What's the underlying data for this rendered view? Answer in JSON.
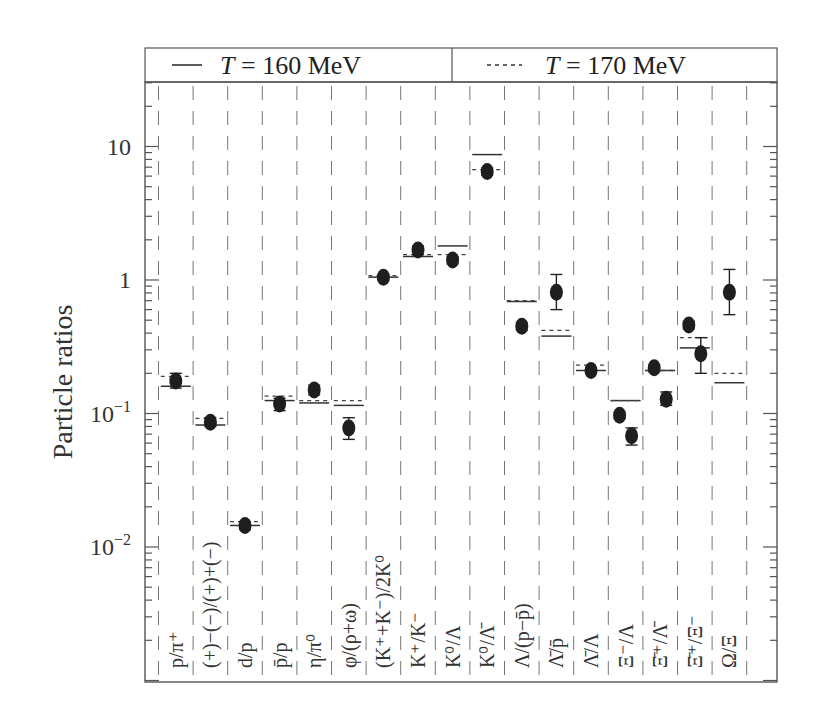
{
  "chart_data": {
    "type": "scatter",
    "title": "",
    "xlabel": "",
    "ylabel": "Particle ratios",
    "yscale": "log",
    "ylim": [
      0.001,
      30
    ],
    "yticks": [
      {
        "value": 10,
        "label": "10"
      },
      {
        "value": 1,
        "label": "1"
      },
      {
        "value": 0.1,
        "label": "10",
        "exp": "−1"
      },
      {
        "value": 0.01,
        "label": "10",
        "exp": "−2"
      }
    ],
    "grid": "vertical dashed separators between categories",
    "legend": {
      "position": "top, boxed",
      "entries": [
        {
          "name": "T = 160 MeV",
          "style": "solid"
        },
        {
          "name": "T = 170 MeV",
          "style": "dashed"
        }
      ]
    },
    "categories": [
      "p/π⁺",
      "(+)−(−)/(+)+(−)",
      "d/p",
      "p̄/p",
      "η/π⁰",
      "φ/(ρ+ω)",
      "(K⁺+K⁻)/2K⁰",
      "K⁺/K⁻",
      "K⁰/Λ",
      "K⁰/Λ̄",
      "Λ/(p−p̄)",
      "Λ̄/p̄",
      "Λ̄/Λ",
      "Ξ⁻/Λ",
      "Ξ̄⁺/Λ̄",
      "Ξ̄⁺/Ξ⁻",
      "Ω/Ξ"
    ],
    "series": [
      {
        "name": "Data",
        "marker": "filled ellipse with error bars",
        "points": [
          {
            "cat": 0,
            "value": 0.175,
            "err_lo": 0.155,
            "err_hi": 0.2
          },
          {
            "cat": 1,
            "value": 0.086,
            "err_lo": 0.08,
            "err_hi": 0.093
          },
          {
            "cat": 2,
            "value": 0.0145,
            "err_lo": 0.0135,
            "err_hi": 0.0155
          },
          {
            "cat": 3,
            "value": 0.118,
            "err_lo": 0.105,
            "err_hi": 0.13
          },
          {
            "cat": 4,
            "value": 0.15,
            "err_lo": 0.138,
            "err_hi": 0.163
          },
          {
            "cat": 5,
            "value": 0.078,
            "err_lo": 0.064,
            "err_hi": 0.093
          },
          {
            "cat": 6,
            "value": 1.05,
            "err_lo": 1.0,
            "err_hi": 1.1
          },
          {
            "cat": 7,
            "value": 1.68,
            "err_lo": 1.55,
            "err_hi": 1.8
          },
          {
            "cat": 8,
            "value": 1.41,
            "err_lo": 1.32,
            "err_hi": 1.5
          },
          {
            "cat": 9,
            "value": 6.5,
            "err_lo": 6.1,
            "err_hi": 6.9
          },
          {
            "cat": 10,
            "value": 0.45,
            "err_lo": 0.42,
            "err_hi": 0.48
          },
          {
            "cat": 11,
            "value": 0.81,
            "err_lo": 0.6,
            "err_hi": 1.1
          },
          {
            "cat": 12,
            "value": 0.21,
            "err_lo": 0.2,
            "err_hi": 0.22
          },
          {
            "cat": 13,
            "value": 0.097,
            "err_lo": 0.092,
            "err_hi": 0.102
          },
          {
            "cat": 13,
            "value": 0.068,
            "err_lo": 0.058,
            "err_hi": 0.078
          },
          {
            "cat": 14,
            "value": 0.22,
            "err_lo": 0.205,
            "err_hi": 0.23
          },
          {
            "cat": 14,
            "value": 0.128,
            "err_lo": 0.115,
            "err_hi": 0.145
          },
          {
            "cat": 15,
            "value": 0.46,
            "err_lo": 0.43,
            "err_hi": 0.49
          },
          {
            "cat": 15,
            "value": 0.28,
            "err_lo": 0.2,
            "err_hi": 0.37
          },
          {
            "cat": 16,
            "value": 0.81,
            "err_lo": 0.55,
            "err_hi": 1.2
          }
        ]
      },
      {
        "name": "T = 160 MeV",
        "style": "solid",
        "values": [
          0.16,
          0.082,
          0.0145,
          0.125,
          0.12,
          0.115,
          1.05,
          1.5,
          1.8,
          8.7,
          0.69,
          0.38,
          0.21,
          0.125,
          0.21,
          0.31,
          0.17
        ]
      },
      {
        "name": "T = 170 MeV",
        "style": "dashed",
        "values": [
          0.19,
          0.092,
          0.0155,
          0.135,
          0.125,
          0.125,
          1.08,
          1.55,
          1.55,
          6.7,
          0.7,
          0.42,
          0.23,
          0.125,
          0.21,
          0.37,
          0.2
        ]
      }
    ]
  },
  "legend": {
    "left": "T = 160 MeV",
    "right": "T = 170 MeV"
  }
}
